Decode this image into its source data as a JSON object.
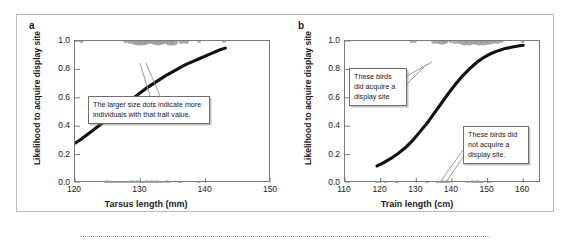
{
  "figure": {
    "panel_a_letter": "a",
    "panel_b_letter": "b"
  },
  "callouts": {
    "a": "The larger size dots indicate more individuals with that trait value.",
    "b_top": "These birds did acquire a display site",
    "b_bottom": "These birds did not acquire a display site."
  },
  "chart_data": [
    {
      "id": "panel-a",
      "type": "scatter",
      "title": "a",
      "xlabel": "Tarsus length (mm)",
      "ylabel": "Likelihood to acquire display site",
      "xlim": [
        120,
        150
      ],
      "ylim": [
        0.0,
        1.0
      ],
      "xticks": [
        120,
        130,
        140,
        150
      ],
      "xtick_labels": [
        "120",
        "130",
        "140",
        "150"
      ],
      "yticks": [
        0.0,
        0.2,
        0.4,
        0.6,
        0.8,
        1.0
      ],
      "ytick_labels": [
        "0.0",
        "0.2",
        "0.4",
        "0.6",
        "0.8",
        "1.0"
      ],
      "grid": false,
      "legend": "none",
      "point_color": "#9a9a9a",
      "curve_color": "#111111",
      "series": [
        {
          "name": "acquired display site (y = 1.0)",
          "points": [
            {
              "x": 121.0,
              "y": 1.0,
              "n": 1
            },
            {
              "x": 127.7,
              "y": 1.0,
              "n": 1
            },
            {
              "x": 128.4,
              "y": 1.0,
              "n": 2
            },
            {
              "x": 129.1,
              "y": 1.0,
              "n": 3
            },
            {
              "x": 129.7,
              "y": 1.0,
              "n": 4
            },
            {
              "x": 130.3,
              "y": 1.0,
              "n": 4
            },
            {
              "x": 130.9,
              "y": 1.0,
              "n": 3
            },
            {
              "x": 131.5,
              "y": 1.0,
              "n": 2
            },
            {
              "x": 132.1,
              "y": 1.0,
              "n": 3
            },
            {
              "x": 132.7,
              "y": 1.0,
              "n": 4
            },
            {
              "x": 133.3,
              "y": 1.0,
              "n": 3
            },
            {
              "x": 133.9,
              "y": 1.0,
              "n": 2
            },
            {
              "x": 134.5,
              "y": 1.0,
              "n": 4
            },
            {
              "x": 135.1,
              "y": 1.0,
              "n": 4
            },
            {
              "x": 136.3,
              "y": 1.0,
              "n": 2
            },
            {
              "x": 137.0,
              "y": 1.0,
              "n": 2
            },
            {
              "x": 139.0,
              "y": 1.0,
              "n": 1
            },
            {
              "x": 142.8,
              "y": 1.0,
              "n": 1
            }
          ]
        },
        {
          "name": "did not acquire display site (y = 0.0)",
          "points": [
            {
              "x": 124.9,
              "y": 0.0,
              "n": 2
            },
            {
              "x": 125.6,
              "y": 0.0,
              "n": 1
            },
            {
              "x": 126.2,
              "y": 0.0,
              "n": 1
            },
            {
              "x": 126.8,
              "y": 0.0,
              "n": 1
            },
            {
              "x": 127.4,
              "y": 0.0,
              "n": 1
            },
            {
              "x": 128.1,
              "y": 0.0,
              "n": 1
            },
            {
              "x": 128.8,
              "y": 0.0,
              "n": 2
            },
            {
              "x": 129.6,
              "y": 0.0,
              "n": 2
            },
            {
              "x": 130.3,
              "y": 0.0,
              "n": 1
            },
            {
              "x": 131.0,
              "y": 0.0,
              "n": 2
            },
            {
              "x": 131.7,
              "y": 0.0,
              "n": 2
            },
            {
              "x": 132.5,
              "y": 0.0,
              "n": 2
            },
            {
              "x": 133.3,
              "y": 0.0,
              "n": 1
            },
            {
              "x": 134.1,
              "y": 0.0,
              "n": 2
            },
            {
              "x": 136.0,
              "y": 0.0,
              "n": 1
            },
            {
              "x": 138.9,
              "y": 0.0,
              "n": 1
            }
          ]
        },
        {
          "name": "logistic fit",
          "type": "line",
          "x": [
            120,
            121,
            122,
            123,
            124,
            125,
            126,
            127,
            128,
            129,
            130,
            131,
            132,
            133,
            134,
            135,
            136,
            137,
            138,
            139,
            140,
            141,
            142,
            143
          ],
          "y": [
            0.28,
            0.31,
            0.345,
            0.38,
            0.415,
            0.45,
            0.49,
            0.53,
            0.565,
            0.6,
            0.635,
            0.67,
            0.7,
            0.73,
            0.76,
            0.785,
            0.81,
            0.835,
            0.855,
            0.875,
            0.895,
            0.915,
            0.935,
            0.95
          ]
        }
      ]
    },
    {
      "id": "panel-b",
      "type": "scatter",
      "title": "b",
      "xlabel": "Train length (cm)",
      "ylabel": "Likelihood to acquire display site",
      "xlim": [
        110,
        165
      ],
      "ylim": [
        0.0,
        1.0
      ],
      "xticks": [
        110,
        120,
        130,
        140,
        150,
        160
      ],
      "xtick_labels": [
        "110",
        "120",
        "130",
        "140",
        "150",
        "160"
      ],
      "yticks": [
        0.0,
        0.2,
        0.4,
        0.6,
        0.8,
        1.0
      ],
      "ytick_labels": [
        "0.0",
        "0.2",
        "0.4",
        "0.6",
        "0.8",
        "1.0"
      ],
      "grid": false,
      "legend": "none",
      "point_color": "#9a9a9a",
      "curve_color": "#111111",
      "series": [
        {
          "name": "acquired display site (y = 1.0)",
          "points": [
            {
              "x": 128.6,
              "y": 1.0,
              "n": 1
            },
            {
              "x": 129.6,
              "y": 1.0,
              "n": 1
            },
            {
              "x": 135.0,
              "y": 1.0,
              "n": 2
            },
            {
              "x": 136.2,
              "y": 1.0,
              "n": 2
            },
            {
              "x": 137.2,
              "y": 1.0,
              "n": 3
            },
            {
              "x": 138.2,
              "y": 1.0,
              "n": 2
            },
            {
              "x": 139.6,
              "y": 1.0,
              "n": 1
            },
            {
              "x": 140.8,
              "y": 1.0,
              "n": 2
            },
            {
              "x": 142.0,
              "y": 1.0,
              "n": 2
            },
            {
              "x": 143.4,
              "y": 1.0,
              "n": 4
            },
            {
              "x": 144.8,
              "y": 1.0,
              "n": 4
            },
            {
              "x": 146.2,
              "y": 1.0,
              "n": 3
            },
            {
              "x": 147.6,
              "y": 1.0,
              "n": 4
            },
            {
              "x": 149.0,
              "y": 1.0,
              "n": 4
            },
            {
              "x": 150.4,
              "y": 1.0,
              "n": 3
            },
            {
              "x": 151.6,
              "y": 1.0,
              "n": 2
            },
            {
              "x": 152.8,
              "y": 1.0,
              "n": 2
            },
            {
              "x": 154.0,
              "y": 1.0,
              "n": 1
            },
            {
              "x": 159.8,
              "y": 1.0,
              "n": 1
            }
          ]
        },
        {
          "name": "did not acquire display site (y = 0.0)",
          "points": [
            {
              "x": 119.0,
              "y": 0.0,
              "n": 1
            },
            {
              "x": 121.4,
              "y": 0.0,
              "n": 1
            },
            {
              "x": 124.6,
              "y": 0.0,
              "n": 1
            },
            {
              "x": 133.0,
              "y": 0.0,
              "n": 1
            },
            {
              "x": 136.0,
              "y": 0.0,
              "n": 1
            },
            {
              "x": 137.4,
              "y": 0.0,
              "n": 2
            },
            {
              "x": 138.6,
              "y": 0.0,
              "n": 2
            },
            {
              "x": 144.4,
              "y": 0.0,
              "n": 1
            },
            {
              "x": 146.0,
              "y": 0.0,
              "n": 2
            },
            {
              "x": 147.2,
              "y": 0.0,
              "n": 2
            },
            {
              "x": 148.4,
              "y": 0.0,
              "n": 1
            },
            {
              "x": 150.6,
              "y": 0.0,
              "n": 1
            }
          ]
        },
        {
          "name": "logistic fit",
          "type": "line",
          "x": [
            119,
            121,
            123,
            125,
            127,
            129,
            131,
            133,
            135,
            137,
            139,
            141,
            143,
            145,
            147,
            149,
            151,
            153,
            155,
            157,
            159,
            160
          ],
          "y": [
            0.12,
            0.145,
            0.175,
            0.21,
            0.25,
            0.3,
            0.36,
            0.42,
            0.49,
            0.56,
            0.63,
            0.695,
            0.755,
            0.805,
            0.85,
            0.885,
            0.912,
            0.932,
            0.948,
            0.958,
            0.966,
            0.97
          ]
        }
      ]
    }
  ]
}
